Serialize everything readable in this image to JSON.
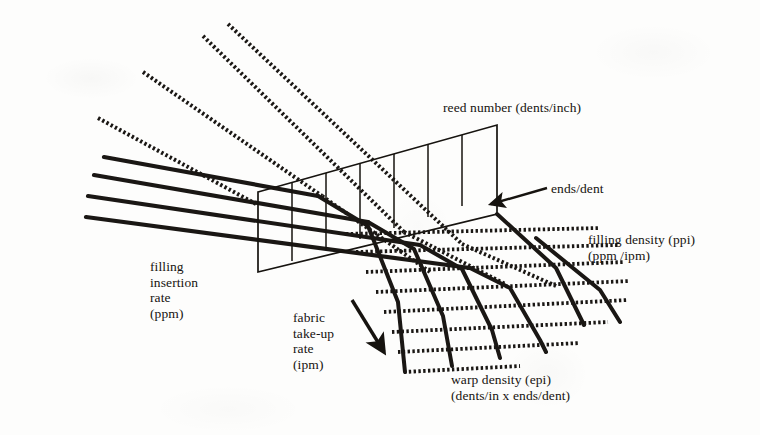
{
  "figure": {
    "type": "technical-line-diagram",
    "background_color": "#fdfdfc",
    "ink_color": "#16130f"
  },
  "labels": {
    "reed_number": "reed number (dents/inch)",
    "ends_per_dent": "ends/dent",
    "filling_density": "filling density (ppi)\n(ppm /ipm)",
    "filling_insertion_rate": "filling\ninsertion\nrate\n(ppm)",
    "fabric_take_up_rate": "fabric\ntake-up\nrate\n(ipm)",
    "warp_density": "warp density (epi)\n(dents/in x ends/dent)"
  },
  "elements": {
    "reed": {
      "name": "reed",
      "dent_count": 7,
      "outline_color": "#16130f",
      "stroke_width": 1.6
    },
    "warp_yarns": {
      "name": "warp ends",
      "count": 4,
      "style": "solid-thick",
      "color": "#1a1714",
      "stroke_width": 4.2
    },
    "filling_yarns": {
      "name": "filling picks",
      "count": 4,
      "style": "dashed-hatched",
      "color": "#1a1714",
      "stroke_width": 4.0,
      "dash": "2.4 2.4"
    },
    "fabric": {
      "name": "woven fabric",
      "warp_lines": 6,
      "filling_lines": 8
    },
    "arrows": {
      "take_up_arrow": {
        "name": "fabric-take-up-arrow",
        "direction": "down-right"
      },
      "ends_dent_arrow": {
        "name": "ends-per-dent-arrow",
        "direction": "left"
      }
    }
  }
}
